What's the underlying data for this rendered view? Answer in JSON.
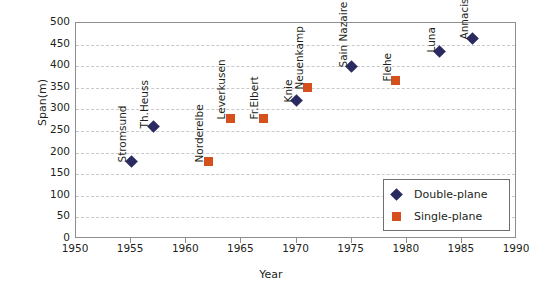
{
  "chart_data": {
    "type": "scatter",
    "title": "",
    "xlabel": "Year",
    "ylabel": "Span(m)",
    "xlim": [
      1950,
      1990
    ],
    "ylim": [
      0,
      500
    ],
    "xticks": [
      1950,
      1955,
      1960,
      1965,
      1970,
      1975,
      1980,
      1985,
      1990
    ],
    "yticks": [
      0,
      50,
      100,
      150,
      200,
      250,
      300,
      350,
      400,
      450,
      500
    ],
    "grid": "horizontal-dashed",
    "legend_position": "bottom-right",
    "colors": {
      "double_plane": "#2b2a60",
      "single_plane": "#d4511e",
      "axis": "#8d8d8d",
      "grid": "#c9c9c9",
      "text": "#231f20"
    },
    "series": [
      {
        "name": "Double-plane",
        "marker": "diamond",
        "color": "#2b2a60",
        "points": [
          {
            "label": "Stromsund",
            "x": 1955,
            "y": 180
          },
          {
            "label": "Th.Heuss",
            "x": 1957,
            "y": 260
          },
          {
            "label": "Knie",
            "x": 1970,
            "y": 320
          },
          {
            "label": "Sain Nazaire",
            "x": 1975,
            "y": 400
          },
          {
            "label": "Luna",
            "x": 1983,
            "y": 435
          },
          {
            "label": "Annacis",
            "x": 1986,
            "y": 465
          }
        ]
      },
      {
        "name": "Single-plane",
        "marker": "square",
        "color": "#d4511e",
        "points": [
          {
            "label": "Norderelbe",
            "x": 1962,
            "y": 180
          },
          {
            "label": "Leverkusen",
            "x": 1964,
            "y": 280
          },
          {
            "label": "Fr.Elbert",
            "x": 1967,
            "y": 280
          },
          {
            "label": "Neuenkamp",
            "x": 1971,
            "y": 350
          },
          {
            "label": "Flehe",
            "x": 1979,
            "y": 368
          }
        ]
      }
    ],
    "legend": [
      {
        "name": "Double-plane",
        "marker": "diamond",
        "color": "#2b2a60"
      },
      {
        "name": "Single-plane",
        "marker": "square",
        "color": "#d4511e"
      }
    ]
  }
}
